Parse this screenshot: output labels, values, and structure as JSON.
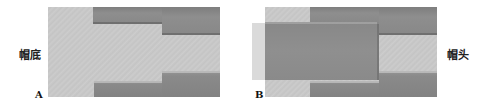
{
  "panels": [
    {
      "id": "A",
      "letter": "A",
      "label": "帽底",
      "description": "Mortise with stepped shoulder, tenon not inserted"
    },
    {
      "id": "B",
      "letter": "B",
      "label": "帽头",
      "description": "Tenon block inserted into stepped mortise"
    }
  ],
  "colors": {
    "light_wood": "#c8c8c8",
    "dark_wood": "#8a8a8a",
    "overlay": "#8e8e8e"
  }
}
